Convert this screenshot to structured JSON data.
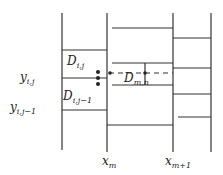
{
  "colors": {
    "line": "#333333",
    "text": "#222222",
    "background": "#ffffff"
  },
  "labels": {
    "D_ij": {
      "base": "D",
      "sub": "i,j"
    },
    "D_ij1": {
      "base": "D",
      "sub": "i,j−1"
    },
    "D_mn": {
      "base": "D",
      "sub": "m,n"
    },
    "y_ij": {
      "base": "y",
      "sub": "i,j"
    },
    "y_ij1": {
      "base": "y",
      "sub": "i,j−1"
    },
    "x_m": {
      "base": "x",
      "sub": "m"
    },
    "x_m1": {
      "base": "x",
      "sub": "m+1"
    }
  }
}
